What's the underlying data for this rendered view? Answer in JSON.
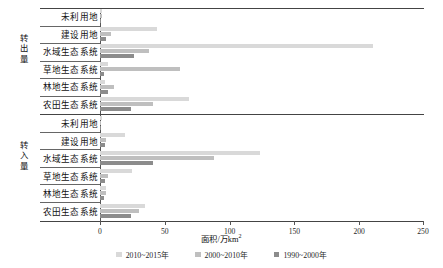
{
  "chart_data": {
    "type": "bar",
    "orientation": "horizontal",
    "title": "",
    "xlabel": "面积/万km²",
    "ylabel": "",
    "xlim": [
      0,
      250
    ],
    "xticks": [
      0,
      50,
      100,
      150,
      200,
      250
    ],
    "grid": false,
    "legend_position": "bottom",
    "series": [
      {
        "name": "2010~2015年",
        "color": "#d9d9d9"
      },
      {
        "name": "2000~2010年",
        "color": "#bfbfbf"
      },
      {
        "name": "1990~2000年",
        "color": "#8c8c8c"
      }
    ],
    "groups": [
      {
        "name": "转出量",
        "categories": [
          "未利用地",
          "建设用地",
          "水域生态系统",
          "草地生态系统",
          "林地生态系统",
          "农田生态系统"
        ],
        "values": {
          "2010~2015年": [
            1.5,
            44.0,
            211.0,
            6.0,
            3.5,
            69.0
          ],
          "2000~2010年": [
            1.2,
            8.5,
            38.0,
            62.0,
            10.5,
            41.0
          ],
          "1990~2000年": [
            1.0,
            5.0,
            26.0,
            3.0,
            6.5,
            24.0
          ]
        }
      },
      {
        "name": "转入量",
        "categories": [
          "未利用地",
          "建设用地",
          "水域生态系统",
          "草地生态系统",
          "林地生态系统",
          "农田生态系统"
        ],
        "values": {
          "2010~2015年": [
            1.4,
            19.0,
            124.0,
            25.0,
            4.5,
            35.0
          ],
          "2000~2010年": [
            1.1,
            4.5,
            88.0,
            6.5,
            5.0,
            30.0
          ],
          "1990~2000年": [
            0.9,
            3.5,
            41.0,
            4.0,
            3.0,
            24.0
          ]
        }
      }
    ]
  },
  "axis": {
    "xlabel_main": "面积/万km",
    "xlabel_sup": "2",
    "tick_0": "0",
    "tick_1": "50",
    "tick_2": "100",
    "tick_3": "150",
    "tick_4": "200",
    "tick_5": "250"
  },
  "groups": {
    "out_label": "转出量",
    "in_label": "转入量"
  },
  "categories": {
    "c0": "未利用地",
    "c1": "建设用地",
    "c2": "水域生态系统",
    "c3": "草地生态系统",
    "c4": "林地生态系统",
    "c5": "农田生态系统"
  },
  "legend": {
    "item0": "2010~2015年",
    "item1": "2000~2010年",
    "item2": "1990~2000年"
  }
}
